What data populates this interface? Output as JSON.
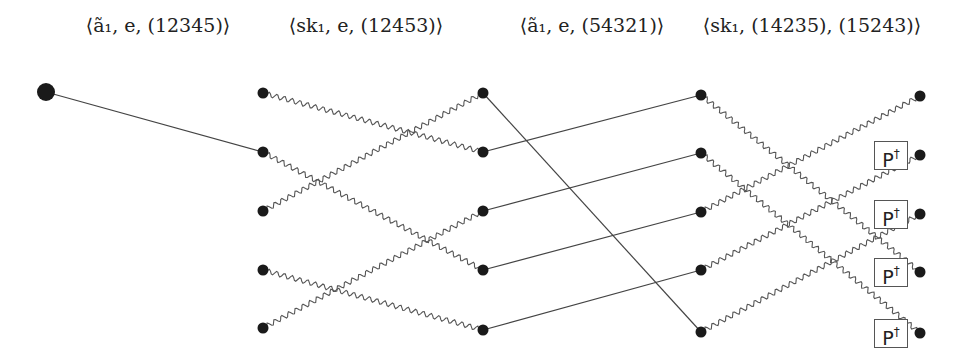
{
  "headers": [
    {
      "text": "⟨ã₁, e, (12345)⟩",
      "x": 158
    },
    {
      "text": "⟨sk₁, e, (12453)⟩",
      "x": 366
    },
    {
      "text": "⟨ã₁, e, (54321)⟩",
      "x": 592
    },
    {
      "text": "⟨sk₁, (14235), (15243)⟩",
      "x": 812
    }
  ],
  "start_node": {
    "x": 46,
    "y": 92,
    "r": 9
  },
  "columns": [
    {
      "x": 263,
      "ys": [
        93,
        152,
        211,
        270,
        328
      ]
    },
    {
      "x": 483,
      "ys": [
        93,
        152,
        211,
        270,
        330
      ]
    },
    {
      "x": 701,
      "ys": [
        95,
        153,
        212,
        270,
        332
      ]
    },
    {
      "x": 920,
      "ys": [
        96,
        155,
        214,
        272,
        333
      ]
    }
  ],
  "node_radius": 5.5,
  "start_edge": {
    "to_col": 0,
    "to_row": 1,
    "style": "straight"
  },
  "transitions": [
    {
      "from_col": 0,
      "to_col": 1,
      "style": "wavy",
      "map": [
        1,
        3,
        0,
        4,
        2
      ]
    },
    {
      "from_col": 1,
      "to_col": 2,
      "style": "straight",
      "map": [
        4,
        0,
        1,
        2,
        3
      ]
    },
    {
      "from_col": 2,
      "to_col": 3,
      "style": "wavy",
      "map": [
        3,
        4,
        0,
        1,
        2
      ]
    }
  ],
  "gate_boxes": {
    "label": "P",
    "superscript": "†",
    "rows": [
      1,
      2,
      3,
      4
    ],
    "x_left": 874
  },
  "colors": {
    "node": "#1a1a1a",
    "line": "#444444",
    "wave": "#555555"
  }
}
